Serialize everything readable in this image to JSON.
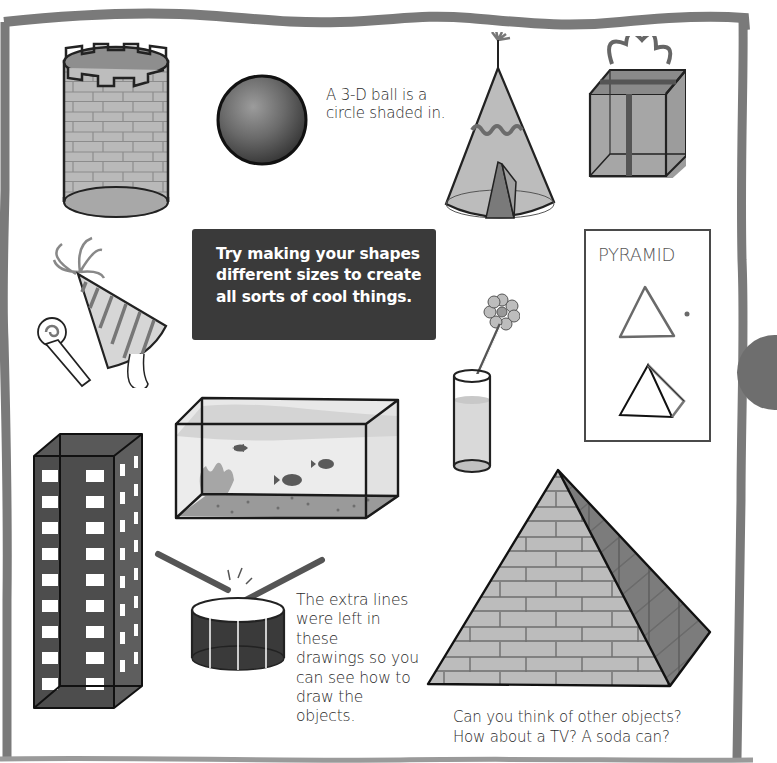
{
  "page": {
    "background": "#ffffff",
    "border_color": "#7a7a7a",
    "tab_color": "#6e6e6e"
  },
  "captions": {
    "ball": {
      "lines": [
        "A 3-D ball is a",
        "circle shaded in."
      ]
    },
    "extra_lines": {
      "lines": [
        "The extra lines",
        "were left in these",
        "drawings so you",
        "can see how to",
        "draw the objects."
      ]
    },
    "other_objects": {
      "lines": [
        "Can you think of other objects?",
        "How about a TV? A soda can?"
      ]
    }
  },
  "tip_box": {
    "background": "#3a3a3a",
    "text_color": "#ffffff",
    "lines": [
      "Try making your shapes",
      "different sizes to create",
      "all sorts of cool things."
    ]
  },
  "pyramid_card": {
    "title": "PYRAMID",
    "steps": [
      "triangle-outline",
      "pyramid-3d-outline"
    ]
  },
  "drawings": [
    {
      "name": "castle-tower",
      "shape": "cylinder"
    },
    {
      "name": "ball",
      "shape": "sphere"
    },
    {
      "name": "teepee",
      "shape": "cone"
    },
    {
      "name": "gift-box",
      "shape": "cube"
    },
    {
      "name": "party-hat",
      "shape": "cone"
    },
    {
      "name": "party-blower",
      "shape": "cylinder"
    },
    {
      "name": "fish-tank",
      "shape": "rectangular-prism"
    },
    {
      "name": "flower-vase",
      "shape": "cylinder"
    },
    {
      "name": "skyscraper",
      "shape": "rectangular-prism"
    },
    {
      "name": "drum",
      "shape": "cylinder"
    },
    {
      "name": "stone-pyramid",
      "shape": "pyramid"
    }
  ]
}
